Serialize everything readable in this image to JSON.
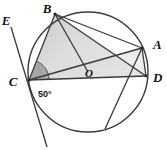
{
  "figure": {
    "kind": "circle-geometry-diagram",
    "background_color": "#ffffff",
    "stroke_color": "#3a3a3a",
    "shade_fill": "#d8d8d8",
    "angle_fill": "#a8a8a8",
    "width": 167,
    "height": 150
  },
  "circle": {
    "center_label": "O",
    "center_x": 88,
    "center_y": 72,
    "radius": 60
  },
  "points": {
    "B": {
      "label": "B",
      "x": 55,
      "y": 14,
      "label_x": 47,
      "label_y": 11
    },
    "A": {
      "label": "A",
      "x": 142,
      "y": 48,
      "label_x": 150,
      "label_y": 47
    },
    "D": {
      "label": "D",
      "x": 146,
      "y": 76,
      "label_x": 151,
      "label_y": 80
    },
    "C": {
      "label": "C",
      "x": 29,
      "y": 80,
      "label_x": 13,
      "label_y": 85
    },
    "E": {
      "label": "E",
      "x": 9,
      "y": 24,
      "label_x": 3,
      "label_y": 22
    },
    "F": {
      "label": "",
      "x": 105,
      "y": 129,
      "label_x": 0,
      "label_y": 0
    }
  },
  "angle": {
    "value_label": "50°",
    "label_x": 38,
    "label_y": 95,
    "vertex": "C",
    "rays": [
      "B",
      "D"
    ]
  },
  "segments": [
    {
      "name": "segment-BC",
      "from": "B",
      "to": "C"
    },
    {
      "name": "segment-BO",
      "from": "B",
      "to": "O"
    },
    {
      "name": "segment-BD",
      "from": "B",
      "to": "D"
    },
    {
      "name": "segment-BA",
      "from": "B",
      "to": "A"
    },
    {
      "name": "segment-CD",
      "from": "C",
      "to": "D"
    },
    {
      "name": "segment-CA",
      "from": "C",
      "to": "A"
    },
    {
      "name": "segment-AD",
      "from": "A",
      "to": "D"
    },
    {
      "name": "segment-AF",
      "from": "A",
      "to": "F"
    }
  ],
  "tangent_line": {
    "name": "tangent-through-C",
    "from_label": "E",
    "x1": 11,
    "y1": 27,
    "x2": 47,
    "y2": 147
  },
  "shaded_regions": [
    {
      "name": "triangle-BCD",
      "vertices": [
        "B",
        "C",
        "D"
      ]
    },
    {
      "name": "angle-sector-at-C",
      "vertices": [
        "C"
      ]
    }
  ]
}
